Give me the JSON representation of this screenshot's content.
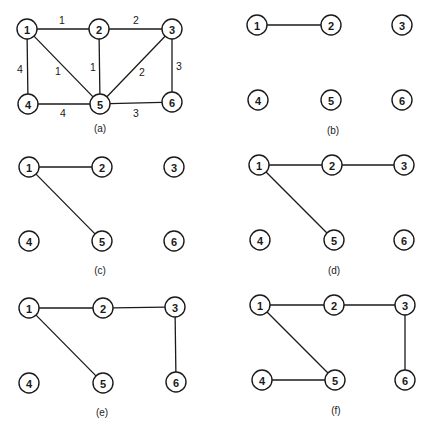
{
  "figure": {
    "node_radius": 10,
    "colors": {
      "stroke": "#1a1a1a",
      "fill": "#ffffff",
      "background": "#ffffff"
    },
    "panels": [
      {
        "id": "a",
        "caption": "(a)",
        "caption_pos": [
          100,
          128
        ],
        "nodes": [
          {
            "label": "1",
            "x": 27,
            "y": 29
          },
          {
            "label": "2",
            "x": 99,
            "y": 29
          },
          {
            "label": "3",
            "x": 172,
            "y": 29
          },
          {
            "label": "4",
            "x": 28,
            "y": 104
          },
          {
            "label": "5",
            "x": 100,
            "y": 104
          },
          {
            "label": "6",
            "x": 172,
            "y": 102
          }
        ],
        "edges": [
          {
            "from": "1",
            "to": "2",
            "weight": "1",
            "label_pos": [
              62,
              20
            ]
          },
          {
            "from": "2",
            "to": "3",
            "weight": "2",
            "label_pos": [
              136,
              20
            ]
          },
          {
            "from": "1",
            "to": "4",
            "weight": "4",
            "label_pos": [
              20,
              69
            ]
          },
          {
            "from": "1",
            "to": "5",
            "weight": "1",
            "label_pos": [
              58,
              71
            ]
          },
          {
            "from": "2",
            "to": "5",
            "weight": "1",
            "label_pos": [
              93,
              67
            ]
          },
          {
            "from": "3",
            "to": "5",
            "weight": "2",
            "label_pos": [
              142,
              72
            ]
          },
          {
            "from": "3",
            "to": "6",
            "weight": "3",
            "label_pos": [
              179,
              66
            ]
          },
          {
            "from": "4",
            "to": "5",
            "weight": "4",
            "label_pos": [
              63,
              113
            ]
          },
          {
            "from": "5",
            "to": "6",
            "weight": "3",
            "label_pos": [
              136,
              113
            ]
          }
        ]
      },
      {
        "id": "b",
        "caption": "(b)",
        "caption_pos": [
          333,
          130
        ],
        "nodes": [
          {
            "label": "1",
            "x": 257,
            "y": 25
          },
          {
            "label": "2",
            "x": 331,
            "y": 25
          },
          {
            "label": "3",
            "x": 402,
            "y": 25
          },
          {
            "label": "4",
            "x": 258,
            "y": 100
          },
          {
            "label": "5",
            "x": 331,
            "y": 100
          },
          {
            "label": "6",
            "x": 402,
            "y": 100
          }
        ],
        "edges": [
          {
            "from": "1",
            "to": "2"
          }
        ]
      },
      {
        "id": "c",
        "caption": "(c)",
        "caption_pos": [
          100,
          270
        ],
        "nodes": [
          {
            "label": "1",
            "x": 29,
            "y": 167
          },
          {
            "label": "2",
            "x": 102,
            "y": 167
          },
          {
            "label": "3",
            "x": 174,
            "y": 167
          },
          {
            "label": "4",
            "x": 29,
            "y": 241
          },
          {
            "label": "5",
            "x": 102,
            "y": 241
          },
          {
            "label": "6",
            "x": 174,
            "y": 241
          }
        ],
        "edges": [
          {
            "from": "1",
            "to": "2"
          },
          {
            "from": "1",
            "to": "5"
          }
        ]
      },
      {
        "id": "d",
        "caption": "(d)",
        "caption_pos": [
          334,
          270
        ],
        "nodes": [
          {
            "label": "1",
            "x": 259,
            "y": 165
          },
          {
            "label": "2",
            "x": 332,
            "y": 165
          },
          {
            "label": "3",
            "x": 404,
            "y": 165
          },
          {
            "label": "4",
            "x": 260,
            "y": 240
          },
          {
            "label": "5",
            "x": 334,
            "y": 240
          },
          {
            "label": "6",
            "x": 404,
            "y": 240
          }
        ],
        "edges": [
          {
            "from": "1",
            "to": "2"
          },
          {
            "from": "2",
            "to": "3"
          },
          {
            "from": "1",
            "to": "5"
          }
        ]
      },
      {
        "id": "e",
        "caption": "(e)",
        "caption_pos": [
          102,
          412
        ],
        "nodes": [
          {
            "label": "1",
            "x": 29,
            "y": 308
          },
          {
            "label": "2",
            "x": 103,
            "y": 308
          },
          {
            "label": "3",
            "x": 175,
            "y": 307
          },
          {
            "label": "4",
            "x": 29,
            "y": 383
          },
          {
            "label": "5",
            "x": 103,
            "y": 383
          },
          {
            "label": "6",
            "x": 176,
            "y": 382
          }
        ],
        "edges": [
          {
            "from": "1",
            "to": "2"
          },
          {
            "from": "2",
            "to": "3"
          },
          {
            "from": "1",
            "to": "5"
          },
          {
            "from": "3",
            "to": "6"
          }
        ]
      },
      {
        "id": "f",
        "caption": "(f)",
        "caption_pos": [
          336,
          410
        ],
        "nodes": [
          {
            "label": "1",
            "x": 260,
            "y": 305
          },
          {
            "label": "2",
            "x": 334,
            "y": 305
          },
          {
            "label": "3",
            "x": 405,
            "y": 305
          },
          {
            "label": "4",
            "x": 262,
            "y": 380
          },
          {
            "label": "5",
            "x": 335,
            "y": 380
          },
          {
            "label": "6",
            "x": 405,
            "y": 380
          }
        ],
        "edges": [
          {
            "from": "1",
            "to": "2"
          },
          {
            "from": "2",
            "to": "3"
          },
          {
            "from": "1",
            "to": "5"
          },
          {
            "from": "3",
            "to": "6"
          },
          {
            "from": "4",
            "to": "5"
          }
        ]
      }
    ]
  }
}
